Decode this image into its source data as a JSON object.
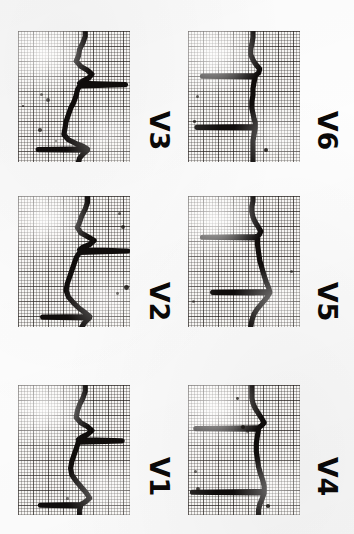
{
  "document": {
    "kind": "scanned-ecg-strip",
    "title": "Precordial leads V1-V6",
    "orientation_degrees": 90,
    "background_color": "#fdfdfd",
    "trace_color": "#100d0c",
    "grid_coarse_color": "#231e1c",
    "grid_fine_color": "#322d2a",
    "paper_color": "#f7f6f4"
  },
  "layout": {
    "columns": 2,
    "rows": 3,
    "left_column_leads": [
      "V3",
      "V2",
      "V1"
    ],
    "right_column_leads": [
      "V6",
      "V5",
      "V4"
    ]
  },
  "chart_data": {
    "type": "line",
    "xlabel": "",
    "ylabel": "",
    "grid": true,
    "legend": "none",
    "note": "ECG waveform traces drawn rotated 90 degrees on standard ECG graph paper; amplitude runs horizontally, time runs vertically downward.",
    "series": [
      {
        "name": "V3",
        "label": "V3",
        "panel": {
          "x": 18,
          "y": 31,
          "width": 112,
          "height": 131
        },
        "baseline_fraction": 0.52,
        "calibration_pulse": true,
        "points": [
          [
            0.6,
            0.0
          ],
          [
            0.6,
            0.04
          ],
          [
            0.58,
            0.09
          ],
          [
            0.55,
            0.14
          ],
          [
            0.54,
            0.19
          ],
          [
            0.52,
            0.23
          ],
          [
            0.56,
            0.27
          ],
          [
            0.62,
            0.3
          ],
          [
            0.66,
            0.33
          ],
          [
            0.63,
            0.36
          ],
          [
            0.58,
            0.38
          ],
          [
            0.55,
            0.4
          ],
          [
            0.96,
            0.41
          ],
          [
            0.55,
            0.42
          ],
          [
            0.53,
            0.45
          ],
          [
            0.52,
            0.49
          ],
          [
            0.5,
            0.54
          ],
          [
            0.47,
            0.59
          ],
          [
            0.45,
            0.64
          ],
          [
            0.43,
            0.69
          ],
          [
            0.42,
            0.74
          ],
          [
            0.41,
            0.79
          ],
          [
            0.45,
            0.83
          ],
          [
            0.52,
            0.86
          ],
          [
            0.58,
            0.88
          ],
          [
            0.62,
            0.9
          ],
          [
            0.18,
            0.905
          ],
          [
            0.62,
            0.91
          ],
          [
            0.58,
            0.94
          ],
          [
            0.55,
            0.97
          ],
          [
            0.54,
            1.0
          ]
        ]
      },
      {
        "name": "V2",
        "label": "V2",
        "panel": {
          "x": 18,
          "y": 196,
          "width": 112,
          "height": 131
        },
        "baseline_fraction": 0.5,
        "calibration_pulse": true,
        "points": [
          [
            0.62,
            0.0
          ],
          [
            0.62,
            0.05
          ],
          [
            0.6,
            0.1
          ],
          [
            0.57,
            0.15
          ],
          [
            0.55,
            0.2
          ],
          [
            0.53,
            0.24
          ],
          [
            0.56,
            0.28
          ],
          [
            0.62,
            0.31
          ],
          [
            0.68,
            0.34
          ],
          [
            0.64,
            0.37
          ],
          [
            0.58,
            0.39
          ],
          [
            0.55,
            0.41
          ],
          [
            0.98,
            0.42
          ],
          [
            0.55,
            0.43
          ],
          [
            0.52,
            0.47
          ],
          [
            0.5,
            0.52
          ],
          [
            0.48,
            0.57
          ],
          [
            0.46,
            0.62
          ],
          [
            0.44,
            0.67
          ],
          [
            0.43,
            0.72
          ],
          [
            0.45,
            0.77
          ],
          [
            0.5,
            0.82
          ],
          [
            0.55,
            0.86
          ],
          [
            0.6,
            0.89
          ],
          [
            0.64,
            0.92
          ],
          [
            0.22,
            0.925
          ],
          [
            0.64,
            0.93
          ],
          [
            0.6,
            0.96
          ],
          [
            0.57,
            1.0
          ]
        ]
      },
      {
        "name": "V1",
        "label": "V1",
        "panel": {
          "x": 18,
          "y": 385,
          "width": 112,
          "height": 130
        },
        "baseline_fraction": 0.5,
        "calibration_pulse": true,
        "points": [
          [
            0.6,
            0.0
          ],
          [
            0.6,
            0.05
          ],
          [
            0.58,
            0.1
          ],
          [
            0.55,
            0.15
          ],
          [
            0.53,
            0.2
          ],
          [
            0.52,
            0.25
          ],
          [
            0.56,
            0.29
          ],
          [
            0.62,
            0.32
          ],
          [
            0.66,
            0.35
          ],
          [
            0.62,
            0.38
          ],
          [
            0.57,
            0.4
          ],
          [
            0.54,
            0.42
          ],
          [
            0.93,
            0.43
          ],
          [
            0.54,
            0.44
          ],
          [
            0.52,
            0.49
          ],
          [
            0.5,
            0.54
          ],
          [
            0.48,
            0.59
          ],
          [
            0.47,
            0.64
          ],
          [
            0.48,
            0.69
          ],
          [
            0.52,
            0.74
          ],
          [
            0.57,
            0.79
          ],
          [
            0.61,
            0.83
          ],
          [
            0.64,
            0.87
          ],
          [
            0.6,
            0.9
          ],
          [
            0.56,
            0.92
          ],
          [
            0.2,
            0.925
          ],
          [
            0.56,
            0.93
          ],
          [
            0.55,
            0.96
          ],
          [
            0.55,
            1.0
          ]
        ]
      },
      {
        "name": "V6",
        "label": "V6",
        "panel": {
          "x": 188,
          "y": 31,
          "width": 112,
          "height": 131
        },
        "baseline_fraction": 0.52,
        "calibration_pulse": true,
        "points": [
          [
            0.58,
            0.0
          ],
          [
            0.58,
            0.05
          ],
          [
            0.57,
            0.1
          ],
          [
            0.56,
            0.14
          ],
          [
            0.56,
            0.18
          ],
          [
            0.58,
            0.22
          ],
          [
            0.61,
            0.26
          ],
          [
            0.64,
            0.29
          ],
          [
            0.63,
            0.32
          ],
          [
            0.6,
            0.34
          ],
          [
            0.13,
            0.345
          ],
          [
            0.6,
            0.35
          ],
          [
            0.59,
            0.39
          ],
          [
            0.58,
            0.44
          ],
          [
            0.58,
            0.49
          ],
          [
            0.57,
            0.54
          ],
          [
            0.57,
            0.59
          ],
          [
            0.58,
            0.63
          ],
          [
            0.59,
            0.67
          ],
          [
            0.6,
            0.7
          ],
          [
            0.6,
            0.73
          ],
          [
            0.08,
            0.735
          ],
          [
            0.6,
            0.74
          ],
          [
            0.59,
            0.79
          ],
          [
            0.58,
            0.84
          ],
          [
            0.58,
            0.89
          ],
          [
            0.58,
            0.94
          ],
          [
            0.58,
            1.0
          ]
        ]
      },
      {
        "name": "V5",
        "label": "V5",
        "panel": {
          "x": 188,
          "y": 196,
          "width": 112,
          "height": 131
        },
        "baseline_fraction": 0.52,
        "calibration_pulse": true,
        "points": [
          [
            0.58,
            0.0
          ],
          [
            0.58,
            0.04
          ],
          [
            0.57,
            0.08
          ],
          [
            0.57,
            0.12
          ],
          [
            0.58,
            0.16
          ],
          [
            0.6,
            0.2
          ],
          [
            0.63,
            0.24
          ],
          [
            0.65,
            0.27
          ],
          [
            0.64,
            0.29
          ],
          [
            0.62,
            0.31
          ],
          [
            0.13,
            0.315
          ],
          [
            0.62,
            0.32
          ],
          [
            0.62,
            0.37
          ],
          [
            0.63,
            0.43
          ],
          [
            0.64,
            0.49
          ],
          [
            0.66,
            0.55
          ],
          [
            0.68,
            0.61
          ],
          [
            0.7,
            0.66
          ],
          [
            0.72,
            0.7
          ],
          [
            0.73,
            0.73
          ],
          [
            0.22,
            0.735
          ],
          [
            0.73,
            0.74
          ],
          [
            0.7,
            0.78
          ],
          [
            0.66,
            0.82
          ],
          [
            0.62,
            0.86
          ],
          [
            0.59,
            0.9
          ],
          [
            0.57,
            0.95
          ],
          [
            0.56,
            1.0
          ]
        ]
      },
      {
        "name": "V4",
        "label": "V4",
        "panel": {
          "x": 188,
          "y": 385,
          "width": 112,
          "height": 130
        },
        "baseline_fraction": 0.52,
        "calibration_pulse": true,
        "points": [
          [
            0.57,
            0.0
          ],
          [
            0.57,
            0.05
          ],
          [
            0.57,
            0.1
          ],
          [
            0.58,
            0.14
          ],
          [
            0.6,
            0.18
          ],
          [
            0.63,
            0.22
          ],
          [
            0.66,
            0.26
          ],
          [
            0.68,
            0.29
          ],
          [
            0.66,
            0.31
          ],
          [
            0.63,
            0.33
          ],
          [
            0.07,
            0.335
          ],
          [
            0.63,
            0.34
          ],
          [
            0.62,
            0.39
          ],
          [
            0.61,
            0.45
          ],
          [
            0.61,
            0.51
          ],
          [
            0.62,
            0.57
          ],
          [
            0.63,
            0.63
          ],
          [
            0.65,
            0.69
          ],
          [
            0.67,
            0.74
          ],
          [
            0.68,
            0.78
          ],
          [
            0.68,
            0.82
          ],
          [
            0.04,
            0.825
          ],
          [
            0.68,
            0.83
          ],
          [
            0.66,
            0.88
          ],
          [
            0.64,
            0.92
          ],
          [
            0.63,
            0.96
          ],
          [
            0.63,
            1.0
          ]
        ]
      }
    ]
  },
  "labels": [
    {
      "name": "V3",
      "text": "V3",
      "x": 140,
      "y": 117
    },
    {
      "name": "V2",
      "text": "V2",
      "x": 140,
      "y": 288
    },
    {
      "name": "V1",
      "text": "V1",
      "x": 140,
      "y": 463
    },
    {
      "name": "V6",
      "text": "V6",
      "x": 308,
      "y": 117
    },
    {
      "name": "V5",
      "text": "V5",
      "x": 308,
      "y": 288
    },
    {
      "name": "V4",
      "text": "V4",
      "x": 308,
      "y": 463
    }
  ],
  "artifacts": {
    "description": "scan specks and ink blots",
    "specks": [
      {
        "x": 40,
        "y": 93,
        "r": 1.6
      },
      {
        "x": 46,
        "y": 98,
        "r": 2.2
      },
      {
        "x": 38,
        "y": 128,
        "r": 1.8
      },
      {
        "x": 22,
        "y": 105,
        "r": 1.2
      },
      {
        "x": 55,
        "y": 140,
        "r": 1.0
      },
      {
        "x": 118,
        "y": 212,
        "r": 1.5
      },
      {
        "x": 121,
        "y": 225,
        "r": 1.9
      },
      {
        "x": 124,
        "y": 285,
        "r": 2.4
      },
      {
        "x": 116,
        "y": 292,
        "r": 1.4
      },
      {
        "x": 196,
        "y": 95,
        "r": 1.6
      },
      {
        "x": 193,
        "y": 120,
        "r": 1.3
      },
      {
        "x": 264,
        "y": 148,
        "r": 2.1
      },
      {
        "x": 192,
        "y": 300,
        "r": 1.5
      },
      {
        "x": 290,
        "y": 270,
        "r": 1.7
      },
      {
        "x": 236,
        "y": 397,
        "r": 1.4
      },
      {
        "x": 241,
        "y": 425,
        "r": 2.0
      },
      {
        "x": 246,
        "y": 430,
        "r": 1.5
      },
      {
        "x": 194,
        "y": 470,
        "r": 1.6
      },
      {
        "x": 196,
        "y": 487,
        "r": 2.2
      },
      {
        "x": 266,
        "y": 504,
        "r": 1.8
      },
      {
        "x": 66,
        "y": 497,
        "r": 1.3
      }
    ]
  }
}
